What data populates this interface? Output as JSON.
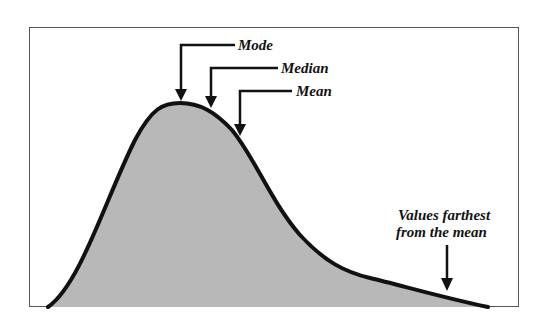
{
  "diagram": {
    "type": "right-skewed distribution curve",
    "fill_color": "#b8b8b8",
    "stroke_color": "#111111",
    "labels": {
      "mode": "Mode",
      "median": "Median",
      "mean": "Mean",
      "tail_line1": "Values farthest",
      "tail_line2": "from the mean"
    }
  }
}
